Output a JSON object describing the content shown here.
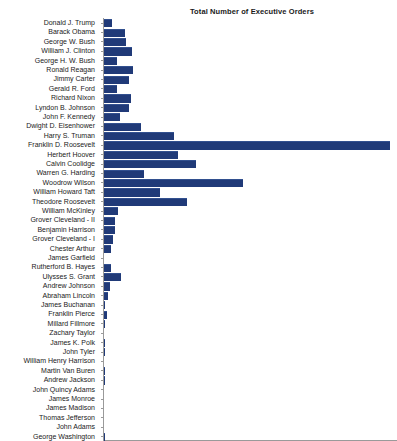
{
  "chart": {
    "title": "Total Number of Executive Orders",
    "axis_color": "#9a9a9a",
    "bar_color": "#203a78"
  },
  "chart_data": {
    "type": "bar",
    "orientation": "horizontal",
    "title": "Total Number of Executive Orders",
    "xlabel": "",
    "ylabel": "",
    "xlim": [
      0,
      3800
    ],
    "grid": false,
    "legend": false,
    "categories": [
      "Donald J. Trump",
      "Barack Obama",
      "George W. Bush",
      "William J. Clinton",
      "George H. W. Bush",
      "Ronald Reagan",
      "Jimmy Carter",
      "Gerald R. Ford",
      "Richard Nixon",
      "Lyndon B. Johnson",
      "John F. Kennedy",
      "Dwight D. Eisenhower",
      "Harry S. Truman",
      "Franklin D. Roosevelt",
      "Herbert Hoover",
      "Calvin Coolidge",
      "Warren G. Harding",
      "Woodrow Wilson",
      "William Howard Taft",
      "Theodore Roosevelt",
      "William McKinley",
      "Grover Cleveland - II",
      "Benjamin Harrison",
      "Grover Cleveland - I",
      "Chester Arthur",
      "James Garfield",
      "Rutherford B. Hayes",
      "Ulysses S. Grant",
      "Andrew Johnson",
      "Abraham Lincoln",
      "James Buchanan",
      "Franklin Pierce",
      "Millard Fillmore",
      "Zachary Taylor",
      "James K. Polk",
      "John Tyler",
      "William Henry Harrison",
      "Martin Van Buren",
      "Andrew Jackson",
      "John Quincy Adams",
      "James Monroe",
      "James Madison",
      "Thomas Jefferson",
      "John Adams",
      "George Washington"
    ],
    "values": [
      104,
      276,
      291,
      364,
      166,
      381,
      320,
      169,
      346,
      325,
      214,
      484,
      907,
      3721,
      968,
      1203,
      522,
      1803,
      724,
      1081,
      185,
      140,
      143,
      113,
      96,
      6,
      92,
      217,
      79,
      48,
      16,
      35,
      12,
      5,
      18,
      17,
      0,
      10,
      12,
      3,
      1,
      1,
      4,
      1,
      8
    ]
  }
}
